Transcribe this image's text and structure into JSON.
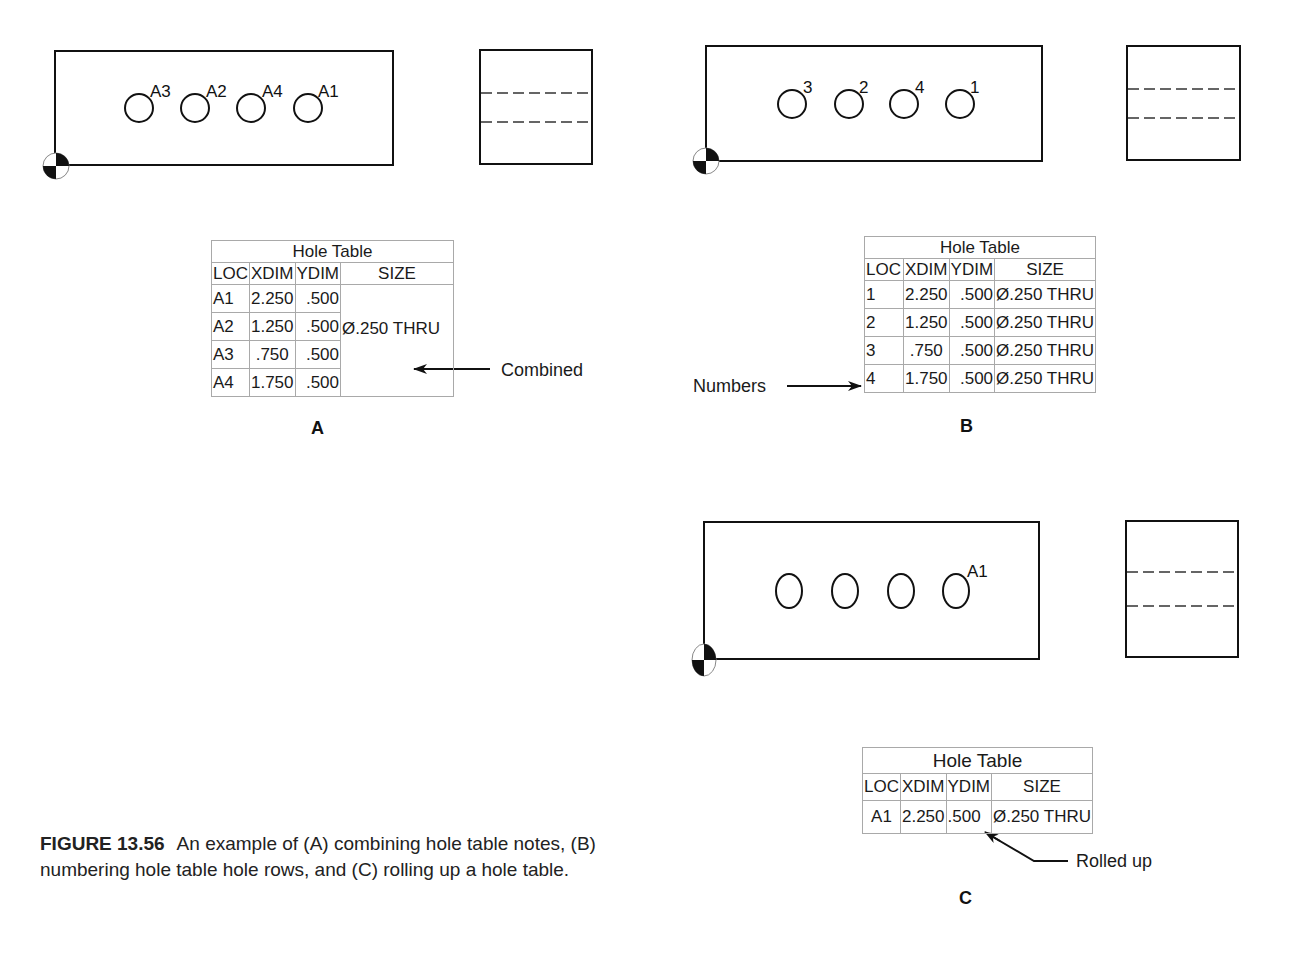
{
  "figure": {
    "number": "FIGURE 13.56",
    "caption": "An example of (A) combining hole table notes, (B) numbering hole table hole rows, and (C) rolling up a hole table."
  },
  "panels": {
    "A": {
      "label": "A",
      "hole_callouts": [
        "A3",
        "A2",
        "A4",
        "A1"
      ],
      "table": {
        "title": "Hole Table",
        "headers": [
          "LOC",
          "XDIM",
          "YDIM",
          "SIZE"
        ],
        "rows": [
          {
            "loc": "A1",
            "xdim": "2.250",
            "ydim": ".500"
          },
          {
            "loc": "A2",
            "xdim": "1.250",
            "ydim": ".500"
          },
          {
            "loc": "A3",
            "xdim": ".750",
            "ydim": ".500"
          },
          {
            "loc": "A4",
            "xdim": "1.750",
            "ydim": ".500"
          }
        ],
        "combined_size": "Ø.250 THRU"
      },
      "annotation": "Combined"
    },
    "B": {
      "label": "B",
      "hole_callouts": [
        "3",
        "2",
        "4",
        "1"
      ],
      "table": {
        "title": "Hole Table",
        "headers": [
          "LOC",
          "XDIM",
          "YDIM",
          "SIZE"
        ],
        "rows": [
          {
            "loc": "1",
            "xdim": "2.250",
            "ydim": ".500",
            "size": "Ø.250 THRU"
          },
          {
            "loc": "2",
            "xdim": "1.250",
            "ydim": ".500",
            "size": "Ø.250 THRU"
          },
          {
            "loc": "3",
            "xdim": ".750",
            "ydim": ".500",
            "size": "Ø.250 THRU"
          },
          {
            "loc": "4",
            "xdim": "1.750",
            "ydim": ".500",
            "size": "Ø.250 THRU"
          }
        ]
      },
      "annotation": "Numbers"
    },
    "C": {
      "label": "C",
      "hole_callouts": [
        "A1"
      ],
      "table": {
        "title": "Hole Table",
        "headers": [
          "LOC",
          "XDIM",
          "YDIM",
          "SIZE"
        ],
        "rows": [
          {
            "loc": "A1",
            "xdim": "2.250",
            "ydim": ".500",
            "size": "Ø.250 THRU"
          }
        ]
      },
      "annotation": "Rolled up"
    }
  }
}
